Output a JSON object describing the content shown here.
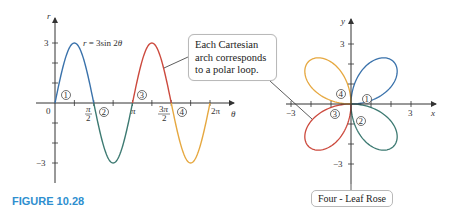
{
  "figure_label": "FIGURE 10.28",
  "callout_text": "Each Cartesian arch corresponds to a polar loop.",
  "rose_label": "Four - Leaf Rose",
  "colors": {
    "loop1": "#3a72ab",
    "loop2": "#3d7a72",
    "loop3": "#cc4a3e",
    "loop4": "#e6a840",
    "axis": "#333333",
    "figure_title": "#2e8fcf"
  },
  "chart_data": [
    {
      "type": "line",
      "title": "r = 3sin 2θ",
      "xlabel": "θ",
      "ylabel": "r",
      "equation": "r = 3sin 2θ",
      "x_ticks": [
        "0",
        "π/2",
        "π",
        "3π/2",
        "2π"
      ],
      "y_ticks": [
        "3",
        "-3"
      ],
      "xlim": [
        0,
        6.2832
      ],
      "ylim": [
        -3,
        3
      ],
      "grid": false,
      "series": [
        {
          "name": "Arch 1",
          "theta_range": [
            0,
            1.5708
          ],
          "peak": 3
        },
        {
          "name": "Arch 2",
          "theta_range": [
            1.5708,
            3.1416
          ],
          "peak": -3
        },
        {
          "name": "Arch 3",
          "theta_range": [
            3.1416,
            4.7124
          ],
          "peak": 3
        },
        {
          "name": "Arch 4",
          "theta_range": [
            4.7124,
            6.2832
          ],
          "peak": -3
        }
      ],
      "annotations": [
        "1",
        "2",
        "3",
        "4"
      ]
    },
    {
      "type": "line",
      "title": "Four - Leaf Rose",
      "xlabel": "x",
      "ylabel": "y",
      "polar_equation": "r = 3sin 2θ",
      "x_ticks": [
        "-3",
        "3"
      ],
      "y_ticks": [
        "3",
        "-3"
      ],
      "xlim": [
        -3,
        3
      ],
      "ylim": [
        -3,
        3
      ],
      "grid": false,
      "series": [
        {
          "name": "Loop 1",
          "quadrant": "I",
          "theta_range": [
            0,
            1.5708
          ]
        },
        {
          "name": "Loop 2",
          "quadrant": "IV",
          "theta_range": [
            1.5708,
            3.1416
          ]
        },
        {
          "name": "Loop 3",
          "quadrant": "III",
          "theta_range": [
            3.1416,
            4.7124
          ]
        },
        {
          "name": "Loop 4",
          "quadrant": "II",
          "theta_range": [
            4.7124,
            6.2832
          ]
        }
      ],
      "annotations": [
        "1",
        "2",
        "3",
        "4"
      ]
    }
  ],
  "left_plot": {
    "y_axis_label": "r",
    "x_axis_label": "θ",
    "equation": "r = 3sin 2θ",
    "tick_0": "0",
    "tick_pi": "π",
    "tick_2pi": "2π",
    "tick_pos3": "3",
    "tick_neg3": "−3",
    "markers": [
      "1",
      "2",
      "3",
      "4"
    ]
  },
  "right_plot": {
    "y_axis_label": "y",
    "x_axis_label": "x",
    "tick_pos3_x": "3",
    "tick_neg3_x": "−3",
    "tick_pos3_y": "3",
    "tick_neg3_y": "−3",
    "markers": [
      "1",
      "2",
      "3",
      "4"
    ]
  }
}
